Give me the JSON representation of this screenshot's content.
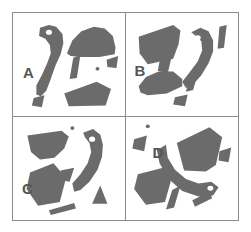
{
  "figure": {
    "type": "shape-fragment-panels",
    "layout": "2x2 grid",
    "panel_count": 4,
    "frame_color": "#8a8a8a",
    "background_color": "#ffffff",
    "shape_fill_color": "#6b6b6b",
    "label_color": "#555555",
    "eye_color": "#ffffff"
  },
  "panels": [
    {
      "label": "A",
      "position": "top-left",
      "fragment_count": 7,
      "has_eye_dot": true,
      "shapes": [
        {
          "name": "curved-hook-with-eye",
          "fill": "#6b6b6b",
          "points": "30,16 46,14 56,24 54,42 46,60 40,78 34,88 28,90 27,80 36,64 42,48 40,36 30,28"
        },
        {
          "name": "dome-cap",
          "fill": "#6b6b6b",
          "points": "62,40 78,18 96,14 110,22 114,40 100,46 78,46"
        },
        {
          "name": "small-wedge-right",
          "fill": "#6b6b6b",
          "points": "106,50 116,48 114,60 104,58"
        },
        {
          "name": "thin-sliver",
          "fill": "#6b6b6b",
          "points": "66,48 74,46 70,70 62,70"
        },
        {
          "name": "quad-bottom",
          "fill": "#6b6b6b",
          "points": "58,86 96,76 108,84 100,100 62,100"
        },
        {
          "name": "tiny-wedge-bottom-left",
          "fill": "#6b6b6b",
          "points": "24,92 34,90 32,102 22,100"
        },
        {
          "name": "dot",
          "fill": "#6b6b6b",
          "points": "92,60 95,58 97,61 94,63"
        }
      ]
    },
    {
      "label": "B",
      "position": "top-right",
      "fragment_count": 7,
      "has_eye_dot": true,
      "shapes": [
        {
          "name": "large-quad-top-left",
          "fill": "#6b6b6b",
          "points": "16,24 56,14 62,22 56,48 24,54"
        },
        {
          "name": "curved-hook-with-eye",
          "fill": "#6b6b6b",
          "points": "70,22 84,16 94,24 96,44 88,62 76,76 66,80 64,70 78,56 84,40 80,30"
        },
        {
          "name": "thin-bar-right",
          "fill": "#6b6b6b",
          "points": "104,16 110,16 108,38 102,38"
        },
        {
          "name": "small-wedge-mid",
          "fill": "#6b6b6b",
          "points": "38,52 48,50 46,64 36,62"
        },
        {
          "name": "dome-cap-bottom",
          "fill": "#6b6b6b",
          "points": "16,76 30,64 52,62 62,72 58,86 24,88"
        },
        {
          "name": "sliver-lower-right",
          "fill": "#6b6b6b",
          "points": "70,66 78,62 74,82 66,84"
        },
        {
          "name": "tiny-wedge-bottom",
          "fill": "#6b6b6b",
          "points": "54,90 66,88 64,100 52,98"
        }
      ]
    },
    {
      "label": "C",
      "position": "bottom-left",
      "fragment_count": 7,
      "has_eye_dot": true,
      "shapes": [
        {
          "name": "dome-cap-top-left",
          "fill": "#6b6b6b",
          "points": "18,18 56,14 62,22 52,42 28,44 18,32"
        },
        {
          "name": "curved-hook-with-eye",
          "fill": "#6b6b6b",
          "points": "76,18 92,14 100,24 98,44 88,64 76,78 68,80 68,70 80,56 86,40 82,28"
        },
        {
          "name": "quad-left",
          "fill": "#6b6b6b",
          "points": "18,58 46,50 58,66 50,90 28,94 16,76"
        },
        {
          "name": "small-wedge-mid",
          "fill": "#6b6b6b",
          "points": "54,56 66,54 62,68 52,66"
        },
        {
          "name": "c-arc-bottom-left",
          "fill": "#6b6b6b",
          "points": "6,76 14,74 12,96 4,94"
        },
        {
          "name": "triangle-bottom-right",
          "fill": "#6b6b6b",
          "points": "92,76 102,76 98,92 88,92"
        },
        {
          "name": "bar-bottom",
          "fill": "#6b6b6b",
          "points": "40,100 66,94 68,100 42,104"
        },
        {
          "name": "dot",
          "fill": "#6b6b6b",
          "points": "64,12 67,10 69,13 66,15"
        }
      ]
    },
    {
      "label": "D",
      "position": "bottom-right",
      "fragment_count": 8,
      "has_eye_dot": true,
      "shapes": [
        {
          "name": "large-quad-top-right",
          "fill": "#6b6b6b",
          "points": "58,26 94,12 104,24 96,54 64,58"
        },
        {
          "name": "curved-hook-with-eye",
          "fill": "#6b6b6b",
          "points": "44,32 52,44 66,60 82,66 96,64 100,74 88,82 68,80 50,68 38,50 36,36"
        },
        {
          "name": "dome-cap-left",
          "fill": "#6b6b6b",
          "points": "14,60 42,54 50,66 42,90 20,92 10,76"
        },
        {
          "name": "small-wedge-upper-left",
          "fill": "#6b6b6b",
          "points": "10,22 22,20 20,36 8,34"
        },
        {
          "name": "small-wedge-right",
          "fill": "#6b6b6b",
          "points": "104,36 114,34 112,48 102,46"
        },
        {
          "name": "sliver-mid-bottom",
          "fill": "#6b6b6b",
          "points": "50,78 58,74 52,96 44,98"
        },
        {
          "name": "bar-bottom-right",
          "fill": "#6b6b6b",
          "points": "74,88 90,82 92,88 76,94"
        },
        {
          "name": "dot",
          "fill": "#6b6b6b",
          "points": "22,10 25,8 27,11 24,13"
        }
      ]
    }
  ]
}
